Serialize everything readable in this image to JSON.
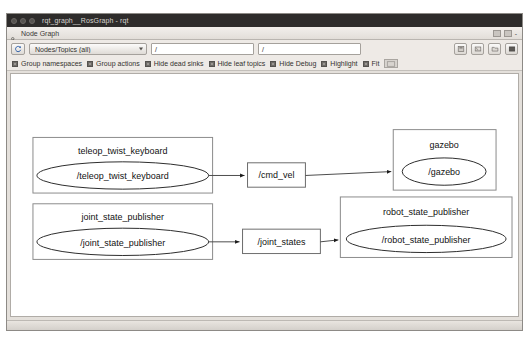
{
  "window": {
    "title": "rqt_graph__RosGraph - rqt",
    "controls": [
      "close",
      "minimize",
      "maximize"
    ]
  },
  "plugin": {
    "title": "Node Graph",
    "icon": "graph-icon",
    "float_button": "float-button",
    "close_button": "close-button",
    "dash": "-"
  },
  "toolbar": {
    "refresh_icon": "refresh-icon",
    "filter_mode": "Nodes/Topics (all)",
    "filter_node_value": "/",
    "filter_topic_value": "/",
    "filter_node_placeholder": "/",
    "filter_topic_placeholder": "/",
    "right_buttons": [
      {
        "name": "save-dot-button",
        "icon": "save-icon"
      },
      {
        "name": "save-image-button",
        "icon": "image-icon"
      },
      {
        "name": "load-button",
        "icon": "folder-icon"
      },
      {
        "name": "fullscreen-button",
        "icon": "screen-icon"
      }
    ],
    "checkboxes": [
      {
        "label": "Group namespaces",
        "checked": true,
        "name": "group-namespaces"
      },
      {
        "label": "Group actions",
        "checked": true,
        "name": "group-actions"
      },
      {
        "label": "Hide dead sinks",
        "checked": true,
        "name": "hide-dead-sinks"
      },
      {
        "label": "Hide leaf topics",
        "checked": true,
        "name": "hide-leaf-topics"
      },
      {
        "label": "Hide Debug",
        "checked": true,
        "name": "hide-debug"
      },
      {
        "label": "Highlight",
        "checked": true,
        "name": "highlight"
      },
      {
        "label": "Fit",
        "checked": true,
        "name": "fit"
      }
    ],
    "fit_button": "fit-extra-button"
  },
  "graph": {
    "groups": [
      {
        "id": "teleop",
        "label": "teleop_twist_keyboard",
        "node": "/teleop_twist_keyboard"
      },
      {
        "id": "gazebo",
        "label": "gazebo",
        "node": "/gazebo"
      },
      {
        "id": "jsp",
        "label": "joint_state_publisher",
        "node": "/joint_state_publisher"
      },
      {
        "id": "rsp",
        "label": "robot_state_publisher",
        "node": "/robot_state_publisher"
      }
    ],
    "topics": [
      {
        "id": "cmd_vel",
        "label": "/cmd_vel"
      },
      {
        "id": "joint_states",
        "label": "/joint_states"
      }
    ],
    "edges": [
      {
        "from": "/teleop_twist_keyboard",
        "to": "/cmd_vel"
      },
      {
        "from": "/cmd_vel",
        "to": "gazebo"
      },
      {
        "from": "/joint_state_publisher",
        "to": "/joint_states"
      },
      {
        "from": "/joint_states",
        "to": "robot_state_publisher"
      }
    ]
  }
}
